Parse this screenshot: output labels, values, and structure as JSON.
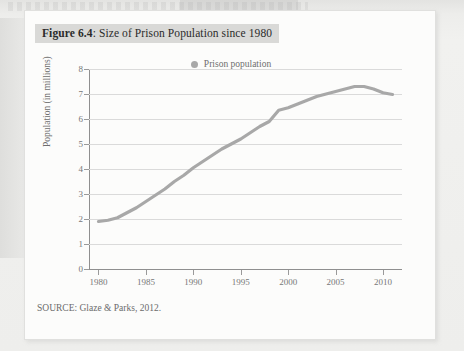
{
  "figure": {
    "label": "Figure 6.4",
    "separator": ": ",
    "title": "Size of Prison Population since 1980",
    "source": "SOURCE: Glaze & Parks, 2012."
  },
  "legend": {
    "entries": [
      {
        "label": "Prison population",
        "color": "#b0b0b0",
        "marker": "circle-dot"
      }
    ],
    "position": "top-center"
  },
  "colors": {
    "line": "#a8a8a8",
    "grid": "#dadada",
    "axis": "#8f8f8f",
    "tick_text": "#777777",
    "title_highlight": "#d9d9d7",
    "card": "#fcfcfb",
    "page": "#eeeeec"
  },
  "chart_data": {
    "type": "line",
    "title": "Size of Prison Population since 1980",
    "xlabel": "",
    "ylabel": "Population (in millions)",
    "xlim": [
      1979,
      2012
    ],
    "ylim": [
      0,
      8
    ],
    "grid": true,
    "legend_position": "top-center",
    "y_ticks": [
      0,
      1,
      2,
      3,
      4,
      5,
      6,
      7,
      8
    ],
    "x_ticks": [
      1980,
      1985,
      1990,
      1995,
      2000,
      2005,
      2010
    ],
    "series": [
      {
        "name": "Prison population",
        "color": "#a8a8a8",
        "x": [
          1980,
          1981,
          1982,
          1983,
          1984,
          1985,
          1986,
          1987,
          1988,
          1989,
          1990,
          1991,
          1992,
          1993,
          1994,
          1995,
          1996,
          1997,
          1998,
          1999,
          2000,
          2001,
          2002,
          2003,
          2004,
          2005,
          2006,
          2007,
          2008,
          2009,
          2010,
          2011
        ],
        "values": [
          1.9,
          1.95,
          2.05,
          2.25,
          2.45,
          2.7,
          2.95,
          3.2,
          3.5,
          3.75,
          4.05,
          4.3,
          4.55,
          4.8,
          5.0,
          5.2,
          5.45,
          5.7,
          5.9,
          6.35,
          6.45,
          6.6,
          6.75,
          6.9,
          7.0,
          7.1,
          7.2,
          7.3,
          7.3,
          7.2,
          7.05,
          6.98
        ]
      }
    ]
  }
}
